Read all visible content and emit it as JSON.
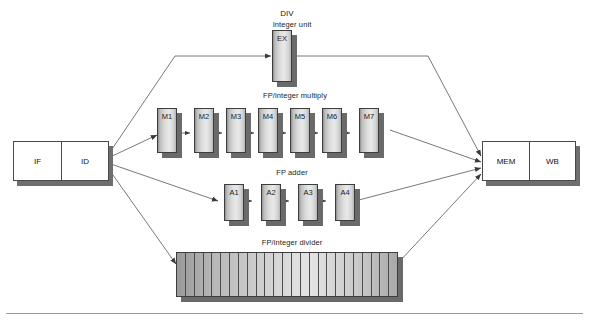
{
  "labels": {
    "integer_unit": "Integer unit",
    "fp_multiply": "FP/integer multiply",
    "fp_adder": "FP adder",
    "fp_divider": "FP/integer divider"
  },
  "front_end": {
    "name": "instruction-fetch-decode",
    "stages": [
      "IF",
      "ID"
    ]
  },
  "back_end": {
    "name": "memory-writeback",
    "stages": [
      "MEM",
      "WB"
    ]
  },
  "integer_unit": {
    "stages": [
      "EX"
    ]
  },
  "multiply_unit": {
    "stages": [
      "M1",
      "M2",
      "M3",
      "M4",
      "M5",
      "M6",
      "M7"
    ]
  },
  "adder_unit": {
    "stages": [
      "A1",
      "A2",
      "A3",
      "A4"
    ]
  },
  "divider_unit": {
    "label": "DIV",
    "segment_count": 25
  },
  "colors": {
    "background": "#ffffff",
    "box_fill_white": "#ffffff",
    "stage_fill_light": "#e9e9e9",
    "stage_fill_dark": "#8f8f8f",
    "outline": "#3d3d3d",
    "shadow": "#6a6a6a",
    "text": "#1a1a1a",
    "rule": "#9a9a9a"
  }
}
